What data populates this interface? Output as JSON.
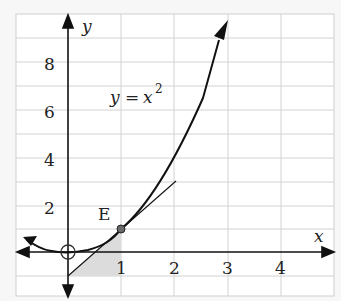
{
  "figure": {
    "type": "function-graph",
    "function_label": "y = x²",
    "function_label_parts": {
      "lhs": "y",
      "eq": "=",
      "var": "x",
      "exp": "2"
    },
    "x_axis_label": "x",
    "y_axis_label": "y",
    "x_ticks": [
      "1",
      "2",
      "3",
      "4"
    ],
    "y_ticks": [
      "2",
      "4",
      "6",
      "8"
    ],
    "point": {
      "label": "E",
      "x": 1,
      "y": 1
    },
    "origin_marker": "open-circle",
    "tangent_line": {
      "equation": "y = 2x - 1",
      "through": [
        1,
        1
      ]
    },
    "shaded_region": "triangle between tangent, y-axis and x=1",
    "colors": {
      "curve": "#111111",
      "grid": "#cfcfcf",
      "shade": "#dcdcdc",
      "point": "#666666"
    }
  }
}
